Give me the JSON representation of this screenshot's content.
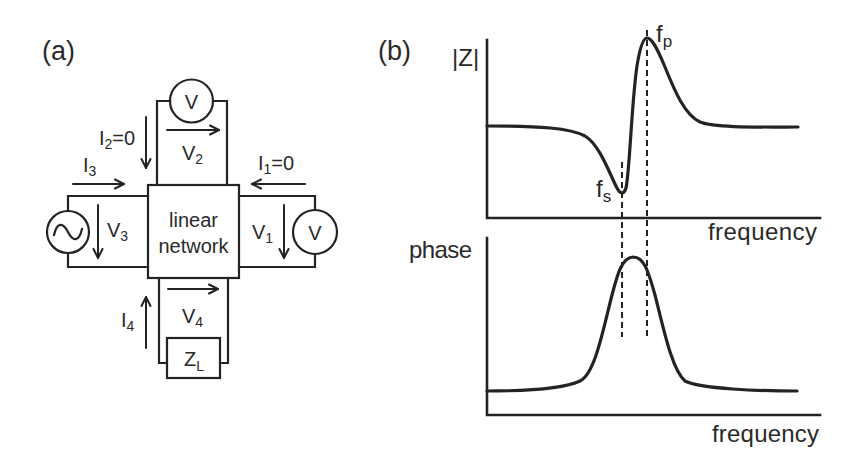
{
  "colors": {
    "ink": "#232323",
    "text": "#2a2a2a",
    "load_fill": "#cfcfcf",
    "background": "#ffffff"
  },
  "panel_a": {
    "label": "(a)",
    "network_box": {
      "line1": "linear",
      "line2": "network"
    },
    "voltmeter_top": {
      "symbol": "V"
    },
    "voltmeter_right": {
      "symbol": "V"
    },
    "source_left": {
      "symbol": "sine-wave-ac-source"
    },
    "load": {
      "main": "Z",
      "sub": "L"
    },
    "labels": {
      "I1": {
        "main": "I",
        "sub": "1",
        "suffix": "=0"
      },
      "I2": {
        "main": "I",
        "sub": "2",
        "suffix": "=0"
      },
      "I3": {
        "main": "I",
        "sub": "3"
      },
      "I4": {
        "main": "I",
        "sub": "4"
      },
      "V1": {
        "main": "V",
        "sub": "1"
      },
      "V2": {
        "main": "V",
        "sub": "2"
      },
      "V3": {
        "main": "V",
        "sub": "3"
      },
      "V4": {
        "main": "V",
        "sub": "4"
      }
    }
  },
  "panel_b": {
    "label": "(b)",
    "top_plot": {
      "ylabel": "|Z|",
      "xlabel": "frequency",
      "marker_series": {
        "main": "f",
        "sub": "s"
      },
      "marker_parallel": {
        "main": "f",
        "sub": "p"
      },
      "curve_path": "M487,126 C540,126 570,128 585,136 C600,145 610,175 617,188 C620,194 624,195 626,188 C630,170 632,90 638,60 C641,44 644,38 647,38 C652,38 657,48 665,67 C675,92 685,115 700,122 C715,128 760,127 798,127",
      "description": "flat baseline, dip to minimum at f_s, sharp rise to maximum at f_p, decay back to baseline"
    },
    "bottom_plot": {
      "ylabel": "phase",
      "xlabel": "frequency",
      "curve_path": "M487,391 C530,391 565,388 580,381 C595,374 603,330 612,295 C618,272 622,258 633,257 C644,257 648,270 655,295 C664,330 672,370 685,381 C700,389 760,391 797,391",
      "description": "flat baseline with a single peak between f_s and f_p"
    }
  }
}
